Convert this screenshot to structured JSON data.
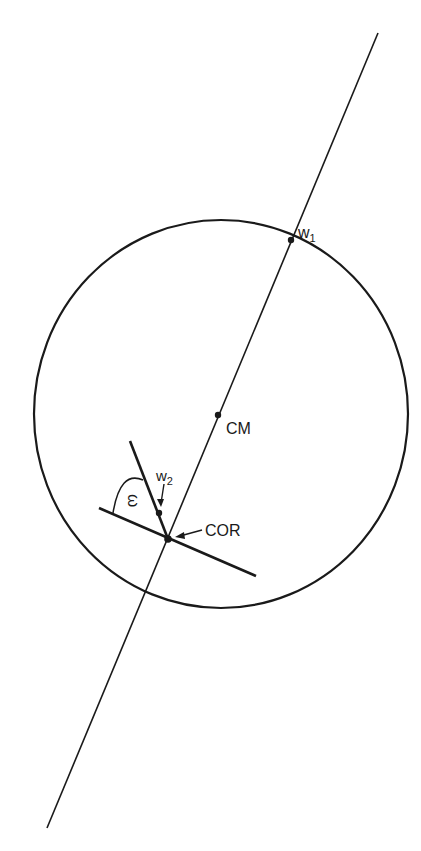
{
  "diagram": {
    "labels": {
      "w1": "w",
      "w1_sub": "1",
      "w2": "w",
      "w2_sub": "2",
      "cm": "CM",
      "cor": "COR",
      "omega": "ω"
    },
    "colors": {
      "ink": "#1a1a1a",
      "background": "#ffffff"
    }
  }
}
